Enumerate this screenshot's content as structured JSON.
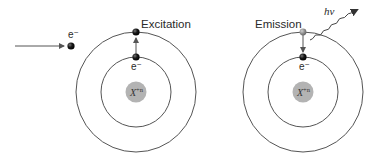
{
  "figure": {
    "type": "atomic excitation and emission diagram",
    "panels": [
      {
        "id": "excitation",
        "title": "Excitation",
        "incoming_electron_label": "e⁻",
        "bound_electron_label": "e⁻",
        "nucleus_label": "X",
        "nucleus_charge": "+n",
        "transition": "inner shell to outer shell (upward arrow)"
      },
      {
        "id": "emission",
        "title": "Emission",
        "bound_electron_label": "e⁻",
        "nucleus_label": "X",
        "nucleus_charge": "+n",
        "photon_label": "hν",
        "transition": "outer shell to inner shell (downward arrow) with photon emitted"
      }
    ],
    "colors": {
      "orbit": "#555555",
      "nucleus_fill": "#b3b3b3",
      "electron": "#1a1a1a",
      "excited_electron_emission": "#8a8a8a",
      "arrow": "#555555",
      "text": "#2a2a2a"
    }
  }
}
